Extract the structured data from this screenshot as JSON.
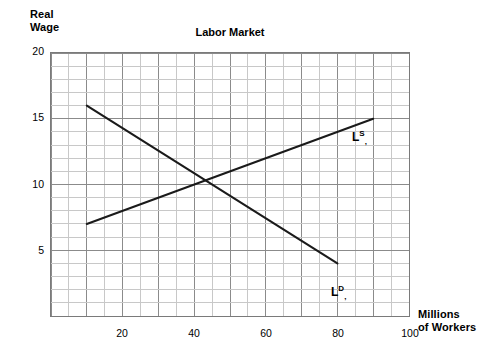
{
  "chart_data": {
    "type": "line",
    "title": "Labor Market",
    "xlabel_line1": "Millions",
    "xlabel_line2": "of Workers",
    "ylabel_line1": "Real",
    "ylabel_line2": "Wage",
    "xlim": [
      0,
      100
    ],
    "ylim": [
      0,
      20
    ],
    "xticks": [
      20,
      40,
      60,
      80,
      100
    ],
    "yticks": [
      5,
      10,
      15,
      20
    ],
    "grid": true,
    "grid_minor_x_step": 5,
    "grid_major_x_step": 10,
    "grid_minor_y_step": 1,
    "grid_major_y_step": 5,
    "legend_position": "inline-annotation",
    "series": [
      {
        "name": "Labor Demand",
        "label_base": "L",
        "label_sup": "D",
        "label_sub": ",",
        "color": "#1a1a1a",
        "points": [
          {
            "x": 10,
            "y": 16
          },
          {
            "x": 80,
            "y": 4
          }
        ]
      },
      {
        "name": "Labor Supply",
        "label_base": "L",
        "label_sup": "S",
        "label_sub": ",",
        "color": "#1a1a1a",
        "points": [
          {
            "x": 10,
            "y": 7
          },
          {
            "x": 90,
            "y": 15
          }
        ]
      }
    ],
    "equilibrium": {
      "x": 40,
      "y": 10
    },
    "colors": {
      "curve": "#1a1a1a",
      "grid_minor": "#c8c8c8",
      "grid_major": "#8a8a8a",
      "frame": "#7a7a7a",
      "text": "#000000",
      "background": "#ffffff"
    }
  }
}
